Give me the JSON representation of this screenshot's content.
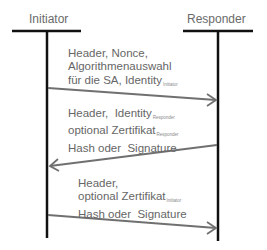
{
  "actors": [
    {
      "id": "initiator",
      "label": "Initiator"
    },
    {
      "id": "responder",
      "label": "Responder"
    }
  ],
  "messages": [
    {
      "direction": "initiator-to-responder",
      "lines": [
        {
          "text": "Header, Nonce,"
        },
        {
          "text": "Algorithmenauswahl"
        },
        {
          "text": "für die SA, Identity",
          "sub": "Initiator"
        }
      ]
    },
    {
      "direction": "responder-to-initiator",
      "lines": [
        {
          "text": "Header,  Identity",
          "sub": "Responder"
        },
        {
          "text": "optional Zertifikat",
          "sub": "Responder"
        },
        {
          "text": "Hash oder  Signature"
        }
      ]
    },
    {
      "direction": "initiator-to-responder",
      "lines": [
        {
          "text": "Header,"
        },
        {
          "text": "optional Zertifikat",
          "sub": "Initiator"
        },
        {
          "text": "Hash oder  Signature"
        }
      ]
    }
  ],
  "colors": {
    "lifeline": "#111111",
    "arrow": "#707070",
    "text": "#666666"
  }
}
